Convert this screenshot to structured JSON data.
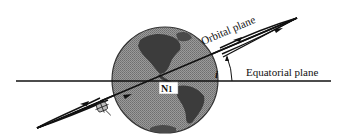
{
  "diagram": {
    "type": "orbital-inclination",
    "labels": {
      "orbital_plane": "Orbital plane",
      "equatorial_plane": "Equatorial plane",
      "inclination_symbol": "i",
      "node_main": "N",
      "node_sub": "1"
    },
    "colors": {
      "globe_fill": "#8a8a8a",
      "land_fill": "#3c3c3c",
      "line": "#111111",
      "background": "#ffffff",
      "node_box": "#ffffff"
    },
    "elements": [
      "globe (Earth, Americas visible)",
      "equatorial plane line (horizontal)",
      "orbital plane (inclined elongated ellipse with direction arrows)",
      "inclination angle arc i",
      "ascending node N1",
      "satellite"
    ]
  }
}
